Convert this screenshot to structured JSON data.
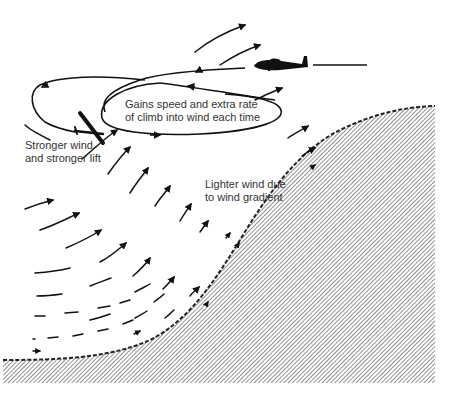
{
  "diagram": {
    "colors": {
      "ink": "#111111",
      "text": "#333333",
      "background": "#ffffff",
      "hatch": "#555555"
    },
    "labels": {
      "loop_note": {
        "line1": "Gains speed and extra rate",
        "line2": "of climb into wind each time"
      },
      "stronger": {
        "line1": "Stronger wind",
        "line2": "and stronger lift"
      },
      "lighter": {
        "line1": "Lighter wind due",
        "line2": "to wind gradient"
      }
    },
    "elements": {
      "glider_top": "glider-side-view-icon",
      "glider_banked": "glider-banking-icon",
      "flight_path": "looping-flight-path",
      "wind_arrows": "wind-vector-field",
      "hill": "hatched-hill-slope"
    }
  }
}
